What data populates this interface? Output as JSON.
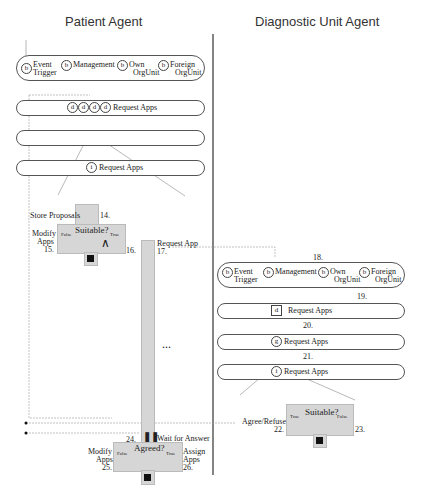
{
  "titles": {
    "left": "Patient Agent",
    "right": "Diagnostic Unit Agent"
  },
  "left": {
    "lane1": {
      "b1a": "Event",
      "b1b": "Trigger",
      "b2": "Management",
      "b3a": "Own",
      "b3b": "OrgUnit",
      "b4a": "Foreign",
      "b4b": "OrgUnit",
      "glyph": "b"
    },
    "lane2": {
      "glyph": "d",
      "label": "Request Apps"
    },
    "lane4": {
      "glyph": "i",
      "label": "Request Apps"
    },
    "decision1": {
      "store": "Store Proposals",
      "n14": "14.",
      "q": "Suitable?",
      "f": "False",
      "t": "True",
      "modify_a": "Modify",
      "modify_b": "Apps",
      "n15": "15.",
      "n16": "16.",
      "req": "Request App",
      "n17": "17."
    },
    "ellipsis": "...",
    "decision2": {
      "n24": "24.",
      "wait": "Wait for Answer",
      "q": "Agreed?",
      "f": "False",
      "t": "True",
      "modify_a": "Modify",
      "modify_b": "Apps",
      "n25": "25.",
      "assign_a": "Assign",
      "assign_b": "Apps",
      "n26": "26."
    }
  },
  "right": {
    "n18": "18.",
    "n19": "19.",
    "n20": "20.",
    "n21": "21.",
    "lane1": {
      "b1a": "Event",
      "b1b": "Trigger",
      "b2": "Management",
      "b3a": "Own",
      "b3b": "OrgUnit",
      "b4a": "Foreign",
      "b4b": "OrgUnit",
      "glyph": "b"
    },
    "lane2": {
      "glyph": "d",
      "label": "Request Apps"
    },
    "lane3": {
      "glyph": "g",
      "label": "Request Apps"
    },
    "lane4": {
      "glyph": "i",
      "label": "Request Apps"
    },
    "decision": {
      "q": "Suitable?",
      "t": "True",
      "f": "False",
      "agree": "Agree/Refuse",
      "n22": "22.",
      "n23": "23."
    }
  }
}
